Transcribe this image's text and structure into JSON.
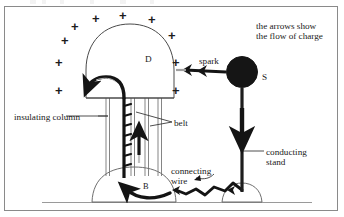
{
  "figure": {
    "border_color": "#8a8a8a",
    "ink_color": "#1a1a1a",
    "background": "#ffffff"
  },
  "labels": {
    "note": "the arrows show\nthe flow of charge",
    "spark": "spark",
    "sphere_s": "S",
    "dome_d": "D",
    "insulating_column": "insulating column",
    "belt": "belt",
    "connecting_wire": "connecting\nwire",
    "conducting_stand": "conducting\nstand",
    "base_b": "B"
  },
  "charges": {
    "symbol": "+",
    "count": 11,
    "positions": [
      {
        "x": 74,
        "y": 21
      },
      {
        "x": 95,
        "y": 14
      },
      {
        "x": 121,
        "y": 13
      },
      {
        "x": 150,
        "y": 17
      },
      {
        "x": 170,
        "y": 32
      },
      {
        "x": 64,
        "y": 36
      },
      {
        "x": 58,
        "y": 57
      },
      {
        "x": 58,
        "y": 85
      },
      {
        "x": 174,
        "y": 58
      },
      {
        "x": 176,
        "y": 86
      },
      {
        "x": 183,
        "y": 45
      }
    ]
  },
  "shapes": {
    "dome_label": "charged dome D",
    "sphere_label": "discharge sphere S",
    "base_label": "base dome B",
    "ground_line": "ground",
    "belt_label": "moving rubber belt",
    "column_label": "insulating column"
  }
}
